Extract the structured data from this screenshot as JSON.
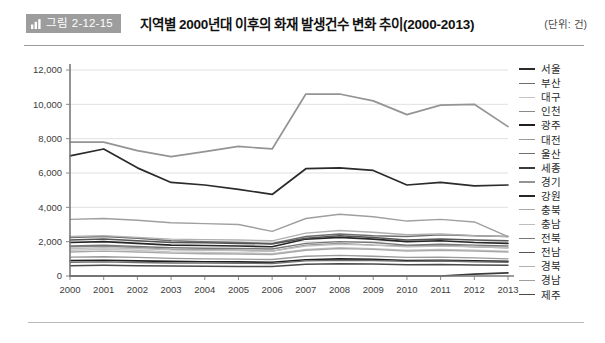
{
  "header": {
    "badge_icon": "bar-chart-icon",
    "badge_label": "그림 2-12-15",
    "title": "지역별 2000년대 이후의 화재 발생건수 변화 추이(2000-2013)",
    "unit_note": "(단위: 건)"
  },
  "chart_data": {
    "type": "line",
    "title": "지역별 2000년대 이후의 화재 발생건수 변화 추이(2000-2013)",
    "xlabel": "",
    "ylabel": "",
    "unit": "건",
    "grid": true,
    "legend_position": "right",
    "ylim": [
      0,
      12000
    ],
    "ytick_labels": [
      "0",
      "2,000",
      "4,000",
      "6,000",
      "8,000",
      "10,000",
      "12,000"
    ],
    "ytick_values": [
      0,
      2000,
      4000,
      6000,
      8000,
      10000,
      12000
    ],
    "categories": [
      "2000",
      "2001",
      "2002",
      "2003",
      "2004",
      "2005",
      "2006",
      "2007",
      "2008",
      "2009",
      "2010",
      "2011",
      "2012",
      "2013"
    ],
    "series": [
      {
        "name": "서울",
        "color": "#2b2b2b",
        "width": 1.7,
        "values": [
          7000,
          7400,
          6300,
          5450,
          5300,
          5050,
          4750,
          6250,
          6300,
          6150,
          5300,
          5450,
          5250,
          5300
        ]
      },
      {
        "name": "부산",
        "color": "#6e6e6e",
        "width": 1.5,
        "values": [
          2250,
          2300,
          2200,
          2050,
          2000,
          1950,
          1900,
          2300,
          2450,
          2350,
          2300,
          2400,
          2350,
          2300
        ]
      },
      {
        "name": "대구",
        "color": "#c4c4c4",
        "width": 1.3,
        "values": [
          1500,
          1550,
          1500,
          1400,
          1380,
          1350,
          1300,
          1550,
          1650,
          1600,
          1500,
          1550,
          1500,
          1450
        ]
      },
      {
        "name": "인천",
        "color": "#8a8a8a",
        "width": 1.4,
        "values": [
          1700,
          1750,
          1650,
          1550,
          1530,
          1500,
          1450,
          1800,
          1900,
          1800,
          1750,
          1800,
          1700,
          1650
        ]
      },
      {
        "name": "광주",
        "color": "#1f1f1f",
        "width": 1.6,
        "values": [
          900,
          920,
          880,
          850,
          830,
          820,
          800,
          950,
          1000,
          980,
          900,
          920,
          880,
          850
        ]
      },
      {
        "name": "대전",
        "color": "#9a9a9a",
        "width": 1.3,
        "values": [
          1100,
          1120,
          1080,
          1030,
          1000,
          980,
          960,
          1150,
          1200,
          1150,
          1080,
          1100,
          1050,
          1000
        ]
      },
      {
        "name": "울산",
        "color": "#707070",
        "width": 1.4,
        "values": [
          800,
          820,
          790,
          760,
          750,
          740,
          730,
          880,
          920,
          900,
          850,
          870,
          830,
          800
        ]
      },
      {
        "name": "세종",
        "color": "#3a3a3a",
        "width": 1.6,
        "values": [
          0,
          0,
          0,
          0,
          0,
          0,
          0,
          0,
          0,
          0,
          0,
          0,
          110,
          180
        ]
      },
      {
        "name": "경기",
        "color": "#949494",
        "width": 1.7,
        "values": [
          7800,
          7800,
          7300,
          6950,
          7250,
          7550,
          7400,
          10600,
          10600,
          10200,
          9400,
          9950,
          10000,
          8700
        ]
      },
      {
        "name": "강원",
        "color": "#262626",
        "width": 1.6,
        "values": [
          1950,
          2000,
          1900,
          1800,
          1780,
          1750,
          1700,
          2150,
          2250,
          2150,
          2000,
          2050,
          1950,
          1900
        ]
      },
      {
        "name": "충북",
        "color": "#a8a8a8",
        "width": 1.4,
        "values": [
          1400,
          1450,
          1400,
          1330,
          1300,
          1280,
          1250,
          1500,
          1600,
          1550,
          1450,
          1500,
          1450,
          1400
        ]
      },
      {
        "name": "충남",
        "color": "#bdbdbd",
        "width": 1.4,
        "values": [
          1600,
          1650,
          1600,
          1520,
          1500,
          1480,
          1450,
          1750,
          1850,
          1800,
          1700,
          1750,
          1700,
          1650
        ]
      },
      {
        "name": "전북",
        "color": "#777777",
        "width": 1.4,
        "values": [
          1750,
          1800,
          1720,
          1650,
          1620,
          1600,
          1570,
          1900,
          2000,
          1950,
          1800,
          1850,
          1800,
          1750
        ]
      },
      {
        "name": "전남",
        "color": "#555555",
        "width": 1.5,
        "values": [
          2100,
          2150,
          2050,
          1950,
          1930,
          1900,
          1870,
          2200,
          2350,
          2250,
          2100,
          2150,
          2100,
          2050
        ]
      },
      {
        "name": "경북",
        "color": "#b0b0b0",
        "width": 1.4,
        "values": [
          2300,
          2350,
          2250,
          2150,
          2120,
          2100,
          2050,
          2500,
          2650,
          2550,
          2400,
          2450,
          2350,
          2300
        ]
      },
      {
        "name": "경남",
        "color": "#9f9f9f",
        "width": 1.4,
        "values": [
          3300,
          3350,
          3250,
          3100,
          3050,
          3000,
          2600,
          3350,
          3600,
          3450,
          3200,
          3300,
          3150,
          2300
        ]
      },
      {
        "name": "제주",
        "color": "#4a4a4a",
        "width": 1.5,
        "values": [
          600,
          620,
          600,
          580,
          570,
          560,
          550,
          680,
          720,
          700,
          650,
          670,
          640,
          620
        ]
      }
    ]
  }
}
